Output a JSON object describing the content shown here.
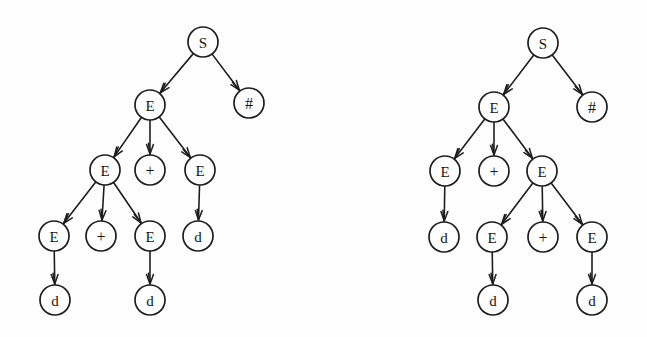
{
  "figure": {
    "background_color": "#fefefe",
    "node_fill": "#ffffff",
    "stroke_color": "#1d1d1d",
    "node_radius": 15
  },
  "trees": [
    {
      "name": "left-parse-tree",
      "nodes": [
        {
          "id": "L0",
          "label": "S",
          "x": 203,
          "y": 42
        },
        {
          "id": "L1",
          "label": "E",
          "x": 150,
          "y": 105
        },
        {
          "id": "L2",
          "label": "#",
          "x": 249,
          "y": 103
        },
        {
          "id": "L3",
          "label": "E",
          "x": 105,
          "y": 170
        },
        {
          "id": "L4",
          "label": "+",
          "x": 150,
          "y": 170
        },
        {
          "id": "L5",
          "label": "E",
          "x": 200,
          "y": 170
        },
        {
          "id": "L6",
          "label": "E",
          "x": 54,
          "y": 236
        },
        {
          "id": "L7",
          "label": "+",
          "x": 101,
          "y": 236
        },
        {
          "id": "L8",
          "label": "E",
          "x": 150,
          "y": 236
        },
        {
          "id": "L9",
          "label": "d",
          "x": 198,
          "y": 236
        },
        {
          "id": "L10",
          "label": "d",
          "x": 55,
          "y": 300
        },
        {
          "id": "L11",
          "label": "d",
          "x": 150,
          "y": 300
        }
      ],
      "edges": [
        {
          "from": "L0",
          "to": "L1"
        },
        {
          "from": "L0",
          "to": "L2"
        },
        {
          "from": "L1",
          "to": "L3"
        },
        {
          "from": "L1",
          "to": "L4"
        },
        {
          "from": "L1",
          "to": "L5"
        },
        {
          "from": "L3",
          "to": "L6"
        },
        {
          "from": "L3",
          "to": "L7"
        },
        {
          "from": "L3",
          "to": "L8"
        },
        {
          "from": "L5",
          "to": "L9"
        },
        {
          "from": "L6",
          "to": "L10"
        },
        {
          "from": "L8",
          "to": "L11"
        }
      ]
    },
    {
      "name": "right-parse-tree",
      "nodes": [
        {
          "id": "R0",
          "label": "S",
          "x": 543,
          "y": 43
        },
        {
          "id": "R1",
          "label": "E",
          "x": 494,
          "y": 107
        },
        {
          "id": "R2",
          "label": "#",
          "x": 592,
          "y": 107
        },
        {
          "id": "R3",
          "label": "E",
          "x": 445,
          "y": 171
        },
        {
          "id": "R4",
          "label": "+",
          "x": 494,
          "y": 171
        },
        {
          "id": "R5",
          "label": "E",
          "x": 542,
          "y": 171
        },
        {
          "id": "R6",
          "label": "d",
          "x": 444,
          "y": 237
        },
        {
          "id": "R7",
          "label": "E",
          "x": 492,
          "y": 237
        },
        {
          "id": "R8",
          "label": "+",
          "x": 543,
          "y": 237
        },
        {
          "id": "R9",
          "label": "E",
          "x": 592,
          "y": 237
        },
        {
          "id": "R10",
          "label": "d",
          "x": 493,
          "y": 300
        },
        {
          "id": "R11",
          "label": "d",
          "x": 592,
          "y": 300
        }
      ],
      "edges": [
        {
          "from": "R0",
          "to": "R1"
        },
        {
          "from": "R0",
          "to": "R2"
        },
        {
          "from": "R1",
          "to": "R3"
        },
        {
          "from": "R1",
          "to": "R4"
        },
        {
          "from": "R1",
          "to": "R5"
        },
        {
          "from": "R3",
          "to": "R6"
        },
        {
          "from": "R5",
          "to": "R7"
        },
        {
          "from": "R5",
          "to": "R8"
        },
        {
          "from": "R5",
          "to": "R9"
        },
        {
          "from": "R7",
          "to": "R10"
        },
        {
          "from": "R9",
          "to": "R11"
        }
      ]
    }
  ]
}
